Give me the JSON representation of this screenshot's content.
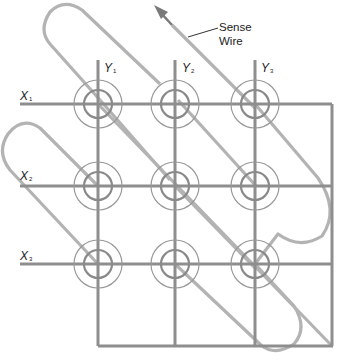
{
  "diagram": {
    "colors": {
      "drive_wire": "#8e8e8e",
      "sense_wire": "#b3b3b3",
      "core_ring": "#999999",
      "label_text": "#222222"
    },
    "x_lines": [
      {
        "label": "X",
        "sub": "1"
      },
      {
        "label": "X",
        "sub": "2"
      },
      {
        "label": "X",
        "sub": "3"
      }
    ],
    "y_lines": [
      {
        "label": "Y",
        "sub": "1"
      },
      {
        "label": "Y",
        "sub": "2"
      },
      {
        "label": "Y",
        "sub": "3"
      }
    ],
    "annotation": {
      "line1": "Sense",
      "line2": "Wire"
    },
    "core_count": 9
  }
}
